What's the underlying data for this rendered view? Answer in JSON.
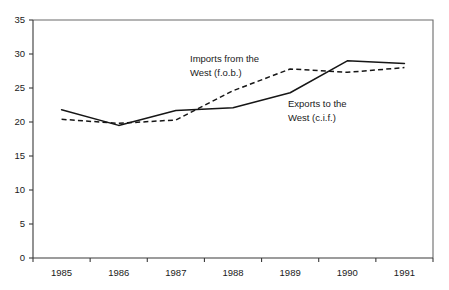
{
  "chart_data": {
    "type": "line",
    "title": "",
    "subtitle": "",
    "xlabel": "",
    "ylabel": "",
    "x": [
      1985,
      1986,
      1987,
      1988,
      1989,
      1990,
      1991
    ],
    "categories": [
      "1985",
      "1986",
      "1987",
      "1988",
      "1989",
      "1990",
      "1991"
    ],
    "xlim": [
      1984.5,
      1991.5
    ],
    "ylim": [
      0,
      35
    ],
    "yticks": [
      0,
      5,
      10,
      15,
      20,
      25,
      30,
      35
    ],
    "ytick_labels": [
      "0",
      "5",
      "10",
      "15",
      "20",
      "25",
      "30",
      "35"
    ],
    "xtick_labels": [
      "1985",
      "1986",
      "1987",
      "1988",
      "1989",
      "1990",
      "1991"
    ],
    "grid": false,
    "legend": "inline annotations",
    "series": [
      {
        "name": "Exports to the West (c.i.f.)",
        "style": "solid",
        "values": [
          21.8,
          19.5,
          21.7,
          22.1,
          24.3,
          29.0,
          28.6
        ]
      },
      {
        "name": "Imports from the West (f.o.b.)",
        "style": "dashed",
        "values": [
          20.4,
          19.8,
          20.3,
          24.6,
          27.8,
          27.3,
          28.0
        ]
      }
    ],
    "annotations": [
      {
        "id": "imports-annotation",
        "line1": "Imports from the",
        "line2": "West (f.o.b.)",
        "x": 190,
        "y": 62
      },
      {
        "id": "exports-annotation",
        "line1": "Exports to the",
        "line2": "West (c.i.f.)",
        "x": 288,
        "y": 107
      }
    ],
    "colors": {
      "series_line": "#161616",
      "axis": "#3a3a3a",
      "frame": "#6b6b6b",
      "text": "#1a1a1a",
      "background": "#ffffff"
    }
  }
}
